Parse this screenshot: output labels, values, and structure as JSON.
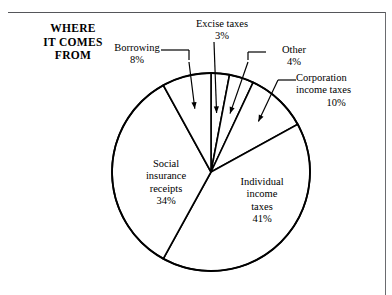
{
  "chart_data": {
    "type": "pie",
    "title": "WHERE IT COMES FROM",
    "categories": [
      "Excise taxes",
      "Other",
      "Corporation income taxes",
      "Individual income taxes",
      "Social insurance receipts",
      "Borrowing"
    ],
    "values": [
      3,
      4,
      10,
      41,
      34,
      8
    ],
    "unit": "%",
    "start_angle_deg": 0,
    "direction": "clockwise",
    "legend": "none",
    "grid": false,
    "slices": [
      {
        "label": "Excise taxes",
        "percent_text": "3%",
        "value": 3,
        "label_placement": "outside-leader"
      },
      {
        "label": "Other",
        "percent_text": "4%",
        "value": 4,
        "label_placement": "outside-leader"
      },
      {
        "label": "Corporation income taxes",
        "percent_text": "10%",
        "value": 10,
        "label_placement": "outside-leader"
      },
      {
        "label": "Individual income taxes",
        "percent_text": "41%",
        "value": 41,
        "label_placement": "inside"
      },
      {
        "label": "Social insurance receipts",
        "percent_text": "34%",
        "value": 34,
        "label_placement": "inside"
      },
      {
        "label": "Borrowing",
        "percent_text": "8%",
        "value": 8,
        "label_placement": "outside-leader"
      }
    ]
  },
  "title": {
    "line1": "WHERE",
    "line2": "IT COMES",
    "line3": "FROM"
  },
  "labels": {
    "excise": {
      "name": "Excise taxes",
      "percent": "3%"
    },
    "borrowing": {
      "name": "Borrowing",
      "percent": "8%"
    },
    "other": {
      "name": "Other",
      "percent": "4%"
    },
    "corporation": {
      "name": "Corporation",
      "name2": "income taxes",
      "percent": "10%"
    },
    "social": {
      "name": "Social",
      "name2": "insurance",
      "name3": "receipts",
      "percent": "34%"
    },
    "individual": {
      "name": "Individual",
      "name2": "income",
      "name3": "taxes",
      "percent": "41%"
    }
  },
  "colors": {
    "stroke": "#000000",
    "fill": "#ffffff",
    "frame": "#55565a"
  }
}
